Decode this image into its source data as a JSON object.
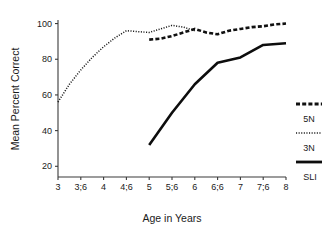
{
  "chart_data": {
    "type": "line",
    "title": "",
    "xlabel": "Age in Years",
    "ylabel": "Mean Percent Correct",
    "grid": false,
    "legend_position": "right",
    "x_categories": [
      "3",
      "3;6",
      "4",
      "4;6",
      "5",
      "5;6",
      "6",
      "6;6",
      "7",
      "7;6",
      "8"
    ],
    "x_tick_labels": [
      "3",
      "3;6",
      "4",
      "4;6",
      "5",
      "5;6",
      "6",
      "6;6",
      "7",
      "7;6",
      "8"
    ],
    "y_tick_labels": [
      "20",
      "40",
      "60",
      "80",
      "100"
    ],
    "y_ticks": [
      20,
      40,
      60,
      80,
      100
    ],
    "ylim": [
      14,
      102
    ],
    "xlim": [
      3,
      8
    ],
    "series": [
      {
        "name": "5N",
        "style": "thick-dashed",
        "x": [
          5,
          5.25,
          5.5,
          5.75,
          6,
          6.25,
          6.5,
          6.75,
          7,
          7.25,
          7.5,
          7.75,
          8
        ],
        "values": [
          91,
          91.5,
          93,
          95,
          97,
          95,
          94,
          96,
          97,
          98,
          98.5,
          99.5,
          100
        ]
      },
      {
        "name": "3N",
        "style": "fine-dotted",
        "x": [
          3,
          3.25,
          3.5,
          3.75,
          4,
          4.25,
          4.5,
          4.75,
          5,
          5.25,
          5.5,
          5.75,
          6
        ],
        "values": [
          56,
          66,
          74,
          81,
          87,
          92,
          96,
          95.5,
          95,
          97,
          99,
          98,
          96
        ]
      },
      {
        "name": "SLI",
        "style": "solid",
        "x": [
          5,
          5.5,
          6,
          6.5,
          7,
          7.5,
          8
        ],
        "values": [
          32,
          50,
          66,
          78,
          81,
          88,
          89
        ]
      }
    ]
  },
  "legend": {
    "entries": [
      {
        "label": "5N",
        "swatch": "thick-dashed-swatch"
      },
      {
        "label": "3N",
        "swatch": "fine-dotted-swatch"
      },
      {
        "label": "SLI",
        "swatch": "solid-line-swatch"
      }
    ]
  },
  "axes": {
    "y_title": "Mean Percent Correct",
    "x_title": "Age in Years"
  }
}
